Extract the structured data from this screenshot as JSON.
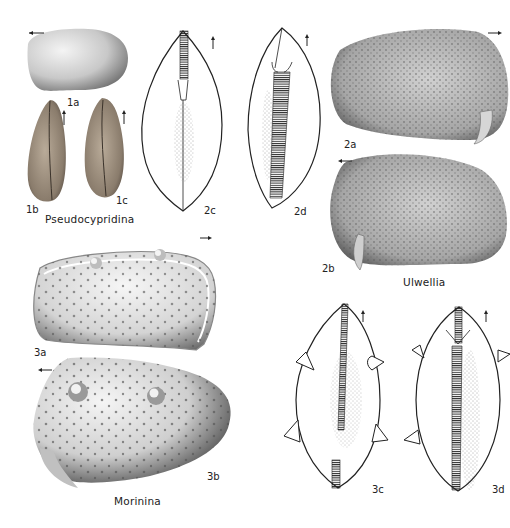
{
  "plate": {
    "figures": [
      {
        "id": "1a",
        "label": "1a",
        "view": "lateral",
        "orientation_arrow": "left"
      },
      {
        "id": "1b",
        "label": "1b",
        "view": "dorsal",
        "orientation_arrow": "up"
      },
      {
        "id": "1c",
        "label": "1c",
        "view": "ventral",
        "orientation_arrow": "up"
      },
      {
        "id": "2a",
        "label": "2a",
        "view": "lateral",
        "orientation_arrow": "right"
      },
      {
        "id": "2b",
        "label": "2b",
        "view": "lateral",
        "orientation_arrow": "left"
      },
      {
        "id": "2c",
        "label": "2c",
        "view": "dorsal-drawing",
        "orientation_arrow": "up"
      },
      {
        "id": "2d",
        "label": "2d",
        "view": "ventral-drawing",
        "orientation_arrow": "up"
      },
      {
        "id": "3a",
        "label": "3a",
        "view": "lateral",
        "orientation_arrow": "right"
      },
      {
        "id": "3b",
        "label": "3b",
        "view": "lateral",
        "orientation_arrow": "left"
      },
      {
        "id": "3c",
        "label": "3c",
        "view": "dorsal-drawing",
        "orientation_arrow": "up"
      },
      {
        "id": "3d",
        "label": "3d",
        "view": "ventral-drawing",
        "orientation_arrow": "up"
      }
    ],
    "genera": {
      "g1": "Pseudocypridina",
      "g2": "Ulwellia",
      "g3": "Morinina"
    }
  },
  "colors": {
    "background": "#ffffff",
    "line": "#222222",
    "shell_light": "#e6e6e6",
    "shell_dark": "#5a5a5a"
  }
}
